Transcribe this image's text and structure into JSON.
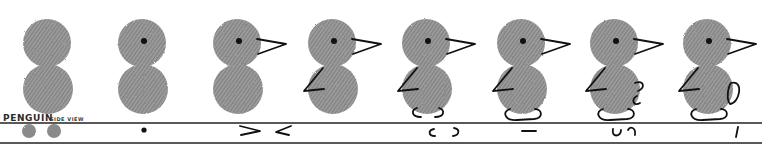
{
  "title": {
    "main": "PENGUIN",
    "sub": "SIDE VIEW"
  },
  "colors": {
    "thumbprint": "#8a8a8a",
    "ink": "#111111",
    "background": "#ffffff"
  },
  "steps": [
    {
      "step": 1,
      "figure": "two stacked thumbprints (head and body)",
      "legend_glyph": "two-gray-dots-icon",
      "parts": []
    },
    {
      "step": 2,
      "figure": "add eye",
      "legend_glyph": "dot-icon",
      "parts": [
        "eye"
      ]
    },
    {
      "step": 3,
      "figure": "add beak",
      "legend_glyph": "beak-strokes-icon",
      "parts": [
        "eye",
        "beak"
      ]
    },
    {
      "step": 4,
      "figure": "add flipper",
      "legend_glyph": "flipper-stroke-icon",
      "parts": [
        "eye",
        "beak",
        "flipper"
      ]
    },
    {
      "step": 5,
      "figure": "add feet outline",
      "legend_glyph": "feet-brackets-icon",
      "parts": [
        "eye",
        "beak",
        "flipper",
        "feet-open"
      ]
    },
    {
      "step": 6,
      "figure": "close feet",
      "legend_glyph": "dash-icon",
      "parts": [
        "eye",
        "beak",
        "flipper",
        "feet-closed"
      ]
    },
    {
      "step": 7,
      "figure": "add tail curl",
      "legend_glyph": "curl-strokes-icon",
      "parts": [
        "eye",
        "beak",
        "flipper",
        "feet-closed",
        "tail-open"
      ]
    },
    {
      "step": 8,
      "figure": "close tail",
      "legend_glyph": "tick-icon",
      "parts": [
        "eye",
        "beak",
        "flipper",
        "feet-closed",
        "tail-closed"
      ]
    }
  ]
}
